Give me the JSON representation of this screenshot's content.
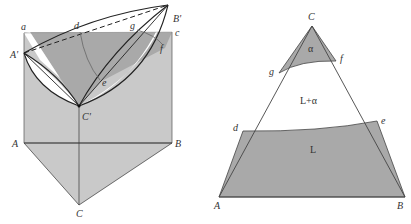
{
  "left_diagram": {
    "description": "3D ternary phase diagram prism with liquidus/solidus surfaces and isothermal plane",
    "labels": {
      "a": "a",
      "d": "d",
      "g": "g",
      "B_prime": "B'",
      "c": "c",
      "A_prime": "A'",
      "f": "f",
      "e": "e",
      "C_prime": "C'",
      "A": "A",
      "B": "B",
      "C": "C"
    },
    "colors": {
      "prism_fill": "#c8c8c8",
      "plane_fill": "#a8a8a8",
      "lens_fill": "#ffffff",
      "stroke": "#222222"
    }
  },
  "right_diagram": {
    "description": "Isothermal section of ternary system",
    "labels": {
      "C": "C",
      "g": "g",
      "f": "f",
      "alpha_region": "α",
      "two_phase_region": "L+α",
      "d": "d",
      "e": "e",
      "liquid_region": "L",
      "A": "A",
      "B": "B"
    },
    "colors": {
      "phase_fill": "#a9a9a9",
      "stroke": "#444444"
    }
  }
}
